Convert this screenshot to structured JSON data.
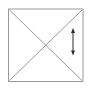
{
  "figure": {
    "title": "Square with both diagonals and a vertical double-headed dimension arrow",
    "background_color": "#ffffff",
    "canvas": {
      "width": 90,
      "height": 93
    },
    "shapes": {
      "square": {
        "name": "square-outline",
        "x": 8.5,
        "y": 9.0,
        "width": 74.5,
        "height": 72.5,
        "stroke_color": "#9a9a9a",
        "stroke_width": 1.0,
        "fill": "none",
        "corners": {
          "top_left": [
            8.5,
            9.0
          ],
          "top_right": [
            83.0,
            9.0
          ],
          "bottom_right": [
            83.0,
            81.5
          ],
          "bottom_left": [
            8.5,
            81.5
          ]
        }
      },
      "diagonal_tl_br": {
        "name": "diagonal-top-left-to-bottom-right",
        "x1": 9.5,
        "y1": 10.0,
        "x2": 82.0,
        "y2": 80.5,
        "stroke_color": "#8c8c8c",
        "stroke_width": 0.9
      },
      "diagonal_tr_bl": {
        "name": "diagonal-top-right-to-bottom-left",
        "x1": 82.0,
        "y1": 10.0,
        "x2": 9.5,
        "y2": 80.5,
        "stroke_color": "#8c8c8c",
        "stroke_width": 0.9
      },
      "intersection_point": {
        "name": "diagonals-intersection",
        "x": 45.75,
        "y": 45.25
      },
      "dimension_arrow": {
        "name": "vertical-double-headed-arrow",
        "x": 73.0,
        "y_top": 28.0,
        "y_bottom": 55.5,
        "length": 27.5,
        "stroke_color": "#2b2b2b",
        "stroke_width": 1.0,
        "head_style": "filled-triangle",
        "head_width": 4.0,
        "head_height": 5.0,
        "double_headed": true
      }
    },
    "labels": {
      "figure_caption": "",
      "dimension_label": ""
    }
  }
}
